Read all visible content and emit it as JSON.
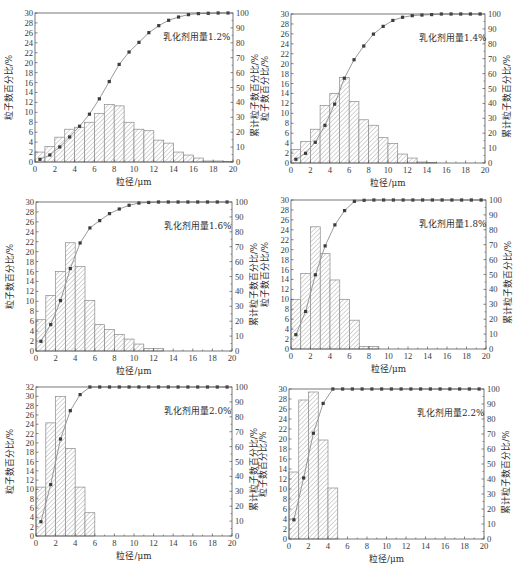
{
  "colors": {
    "background": "#ffffff",
    "axis": "#555555",
    "bar_edge": "#8a8a8a",
    "bar_hatch": "#a3a3a3",
    "line": "#8e8e8e",
    "marker": "#3c3c3c"
  },
  "chart_data": [
    {
      "type": "bar",
      "title": "",
      "annotation": "乳化剂用量1.2%",
      "xlabel": "粒径/μm",
      "ylabel": "粒子数百分比/%",
      "ylabel_right": "累计粒子数百分比/%",
      "xlim": [
        0,
        20
      ],
      "ylim": [
        0,
        30
      ],
      "ylim_right": [
        0,
        100
      ],
      "xticks": [
        0,
        2,
        4,
        6,
        8,
        10,
        12,
        14,
        16,
        18,
        20
      ],
      "yticks": [
        0,
        2,
        4,
        6,
        8,
        10,
        12,
        14,
        16,
        18,
        20,
        22,
        24,
        26,
        28,
        30
      ],
      "yticks_right": [
        0,
        10,
        20,
        30,
        40,
        50,
        60,
        70,
        80,
        90,
        100
      ],
      "grid": false,
      "legend": "none",
      "x": [
        0.5,
        1.5,
        2.5,
        3.5,
        4.5,
        5.5,
        6.5,
        7.5,
        8.5,
        9.5,
        10.5,
        11.5,
        12.5,
        13.5,
        14.5,
        15.5,
        16.5,
        17.5,
        18.5,
        19.5
      ],
      "series": [
        {
          "name": "粒子数百分比",
          "type": "bar",
          "axis": "left",
          "bin_width": 1,
          "values": [
            2.0,
            3.1,
            5.0,
            6.6,
            7.0,
            8.0,
            9.8,
            11.6,
            11.3,
            8.0,
            6.6,
            6.3,
            4.4,
            3.8,
            2.0,
            1.4,
            0.8,
            0.2,
            0.2,
            0.1
          ]
        },
        {
          "name": "累计粒子数百分比",
          "type": "line",
          "axis": "right",
          "marker": "square",
          "values": [
            1.8,
            4.7,
            10.1,
            16.8,
            24.0,
            32.1,
            42.4,
            54.0,
            65.5,
            73.8,
            80.3,
            86.8,
            91.5,
            95.1,
            97.3,
            98.9,
            99.6,
            99.8,
            100,
            100
          ]
        }
      ]
    },
    {
      "type": "bar",
      "title": "",
      "annotation": "乳化剂用量1.4%",
      "xlabel": "粒径/μm",
      "ylabel": "粒子数百分比/%",
      "ylabel_right": "累计粒子数百分比/%",
      "xlim": [
        0,
        20
      ],
      "ylim": [
        0,
        30
      ],
      "ylim_right": [
        0,
        100
      ],
      "xticks": [
        0,
        2,
        4,
        6,
        8,
        10,
        12,
        14,
        16,
        18,
        20
      ],
      "yticks": [
        0,
        2,
        4,
        6,
        8,
        10,
        12,
        14,
        16,
        18,
        20,
        22,
        24,
        26,
        28,
        30
      ],
      "yticks_right": [
        0,
        10,
        20,
        30,
        40,
        50,
        60,
        70,
        80,
        90,
        100
      ],
      "grid": false,
      "legend": "none",
      "x": [
        0.5,
        1.5,
        2.5,
        3.5,
        4.5,
        5.5,
        6.5,
        7.5,
        8.5,
        9.5,
        10.5,
        11.5,
        12.5,
        13.5,
        14.5,
        15.5,
        16.5,
        17.5,
        18.5,
        19.5
      ],
      "series": [
        {
          "name": "粒子数百分比",
          "type": "bar",
          "axis": "left",
          "bin_width": 1,
          "values": [
            2.7,
            4.3,
            6.8,
            11.6,
            14.0,
            17.2,
            12.4,
            8.7,
            7.6,
            5.1,
            3.9,
            1.8,
            1.0,
            0.2,
            0.1,
            0,
            0,
            0,
            0,
            0
          ]
        },
        {
          "name": "累计粒子数百分比",
          "type": "line",
          "axis": "right",
          "marker": "square",
          "values": [
            2.5,
            6.5,
            13.9,
            25.3,
            39.5,
            56.9,
            69.3,
            78.5,
            86.5,
            91.7,
            95.7,
            97.8,
            98.9,
            99.3,
            99.6,
            100,
            100,
            100,
            100,
            100
          ]
        }
      ]
    },
    {
      "type": "bar",
      "title": "",
      "annotation": "乳化剂用量1.6%",
      "xlabel": "粒径/μm",
      "ylabel": "粒子数百分比/%",
      "ylabel_right": "累计粒子数百分比/%",
      "xlim": [
        0,
        20
      ],
      "ylim": [
        0,
        30
      ],
      "ylim_right": [
        0,
        100
      ],
      "xticks": [
        0,
        2,
        4,
        6,
        8,
        10,
        12,
        14,
        16,
        18,
        20
      ],
      "yticks": [
        0,
        2,
        4,
        6,
        8,
        10,
        12,
        14,
        16,
        18,
        20,
        22,
        24,
        26,
        28,
        30
      ],
      "yticks_right": [
        0,
        10,
        20,
        30,
        40,
        50,
        60,
        70,
        80,
        90,
        100
      ],
      "grid": false,
      "legend": "none",
      "x": [
        0.5,
        1.5,
        2.5,
        3.5,
        4.5,
        5.5,
        6.5,
        7.5,
        8.5,
        9.5,
        10.5,
        11.5,
        12.5,
        13.5,
        14.5,
        15.5,
        16.5,
        17.5,
        18.5,
        19.5
      ],
      "series": [
        {
          "name": "粒子数百分比",
          "type": "bar",
          "axis": "left",
          "bin_width": 1,
          "values": [
            6.3,
            11.2,
            16.0,
            21.8,
            17.0,
            10.2,
            5.3,
            4.3,
            3.3,
            2.4,
            1.4,
            0.5,
            0.5,
            0,
            0,
            0,
            0,
            0,
            0,
            0
          ]
        },
        {
          "name": "累计粒子数百分比",
          "type": "line",
          "axis": "right",
          "marker": "square",
          "values": [
            6.5,
            17.7,
            33.8,
            55.3,
            72.5,
            82.6,
            87.5,
            92.2,
            95.3,
            97.8,
            99.3,
            99.7,
            100,
            100,
            100,
            100,
            100,
            100,
            100,
            100
          ]
        }
      ]
    },
    {
      "type": "bar",
      "title": "",
      "annotation": "乳化剂用量1.8%",
      "xlabel": "粒径/μm",
      "ylabel": "粒子数百分比/%",
      "ylabel_right": "累计粒子数百分比/%",
      "xlim": [
        0,
        20
      ],
      "ylim": [
        0,
        30
      ],
      "ylim_right": [
        0,
        100
      ],
      "xticks": [
        0,
        2,
        4,
        6,
        8,
        10,
        12,
        14,
        16,
        18,
        20
      ],
      "yticks": [
        0,
        2,
        4,
        6,
        8,
        10,
        12,
        14,
        16,
        18,
        20,
        22,
        24,
        26,
        28,
        30
      ],
      "yticks_right": [
        0,
        10,
        20,
        30,
        40,
        50,
        60,
        70,
        80,
        90,
        100
      ],
      "grid": false,
      "legend": "none",
      "x": [
        0.5,
        1.5,
        2.5,
        3.5,
        4.5,
        5.5,
        6.5,
        7.5,
        8.5,
        9.5,
        10.5,
        11.5,
        12.5,
        13.5,
        14.5,
        15.5,
        16.5,
        17.5,
        18.5,
        19.5
      ],
      "series": [
        {
          "name": "粒子数百分比",
          "type": "bar",
          "axis": "left",
          "bin_width": 1,
          "values": [
            10.0,
            15.2,
            24.6,
            19.2,
            13.9,
            10.0,
            5.8,
            0.5,
            0.5,
            0,
            0,
            0,
            0,
            0,
            0,
            0,
            0,
            0,
            0,
            0
          ]
        },
        {
          "name": "累计粒子数百分比",
          "type": "line",
          "axis": "right",
          "marker": "square",
          "values": [
            9.6,
            25.2,
            49.8,
            69.2,
            83.3,
            92.9,
            99.1,
            99.8,
            100,
            100,
            100,
            100,
            100,
            100,
            100,
            100,
            100,
            100,
            100,
            100
          ]
        }
      ]
    },
    {
      "type": "bar",
      "title": "",
      "annotation": "乳化剂用量2.0%",
      "xlabel": "粒径/μm",
      "ylabel": "粒子数百分比/%",
      "ylabel_right": "累计粒子数百分比/%",
      "xlim": [
        0,
        20
      ],
      "ylim": [
        0,
        32
      ],
      "ylim_right": [
        0,
        100
      ],
      "xticks": [
        0,
        2,
        4,
        6,
        8,
        10,
        12,
        14,
        16,
        18,
        20
      ],
      "yticks": [
        0,
        2,
        4,
        6,
        8,
        10,
        12,
        14,
        16,
        18,
        20,
        22,
        24,
        26,
        28,
        30,
        32
      ],
      "yticks_right": [
        0,
        10,
        20,
        30,
        40,
        50,
        60,
        70,
        80,
        90,
        100
      ],
      "grid": false,
      "legend": "none",
      "x": [
        0.5,
        1.5,
        2.5,
        3.5,
        4.5,
        5.5,
        6.5,
        7.5,
        8.5,
        9.5,
        10.5,
        11.5,
        12.5,
        13.5,
        14.5,
        15.5,
        16.5,
        17.5,
        18.5,
        19.5
      ],
      "series": [
        {
          "name": "粒子数百分比",
          "type": "bar",
          "axis": "left",
          "bin_width": 1,
          "values": [
            10.5,
            24.3,
            30.0,
            18.8,
            10.5,
            5.0,
            0,
            0,
            0,
            0,
            0,
            0,
            0,
            0,
            0,
            0,
            0,
            0,
            0,
            0
          ]
        },
        {
          "name": "累计粒子数百分比",
          "type": "line",
          "axis": "right",
          "marker": "square",
          "values": [
            9.6,
            34.5,
            65.1,
            84.1,
            94.9,
            100,
            100,
            100,
            100,
            100,
            100,
            100,
            100,
            100,
            100,
            100,
            100,
            100,
            100,
            100
          ]
        }
      ]
    },
    {
      "type": "bar",
      "title": "",
      "annotation": "乳化剂用量2.2%",
      "xlabel": "粒径/μm",
      "ylabel": "粒子数百分比/%",
      "ylabel_right": "累计粒子数百分比/%",
      "xlim": [
        0,
        20
      ],
      "ylim": [
        0,
        30
      ],
      "ylim_right": [
        0,
        100
      ],
      "xticks": [
        0,
        2,
        4,
        6,
        8,
        10,
        12,
        14,
        16,
        18,
        20
      ],
      "yticks": [
        0,
        2,
        4,
        6,
        8,
        10,
        12,
        14,
        16,
        18,
        20,
        22,
        24,
        26,
        28,
        30
      ],
      "yticks_right": [
        0,
        10,
        20,
        30,
        40,
        50,
        60,
        70,
        80,
        90,
        100
      ],
      "grid": false,
      "legend": "none",
      "x": [
        0.5,
        1.5,
        2.5,
        3.5,
        4.5,
        5.5,
        6.5,
        7.5,
        8.5,
        9.5,
        10.5,
        11.5,
        12.5,
        13.5,
        14.5,
        15.5,
        16.5,
        17.5,
        18.5,
        19.5
      ],
      "series": [
        {
          "name": "粒子数百分比",
          "type": "bar",
          "axis": "left",
          "bin_width": 1,
          "values": [
            13.4,
            27.8,
            29.4,
            19.8,
            10.2,
            0,
            0,
            0,
            0,
            0,
            0,
            0,
            0,
            0,
            0,
            0,
            0,
            0,
            0,
            0
          ]
        },
        {
          "name": "累计粒子数百分比",
          "type": "line",
          "axis": "right",
          "marker": "square",
          "values": [
            12.8,
            40.7,
            70.5,
            90.4,
            100,
            100,
            100,
            100,
            100,
            100,
            100,
            100,
            100,
            100,
            100,
            100,
            100,
            100,
            100,
            100
          ]
        }
      ]
    }
  ]
}
